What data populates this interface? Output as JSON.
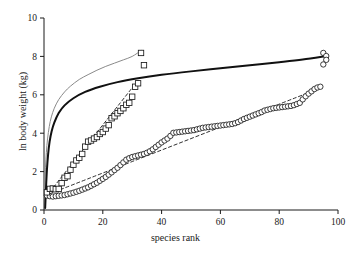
{
  "chart_data": {
    "type": "scatter",
    "title": "",
    "xlabel": "species rank",
    "ylabel": "ln body weight (kg)",
    "xlim": [
      0,
      100
    ],
    "ylim": [
      0,
      10
    ],
    "xticks": [
      0,
      20,
      40,
      60,
      80,
      100
    ],
    "yticks": [
      0,
      2,
      4,
      6,
      8,
      10
    ],
    "xtick_labels": [
      "0",
      "20",
      "40",
      "60",
      "80",
      "100"
    ],
    "ytick_labels": [
      "0",
      "2",
      "4",
      "6",
      "8",
      "10"
    ],
    "grid": false,
    "legend": "none",
    "axis_style": "left-and-bottom-spines-with-outward-ticks",
    "series": [
      {
        "name": "open-circles",
        "marker": "open-circle",
        "color": "#1a1a1a",
        "points": [
          [
            1,
            0.75
          ],
          [
            2,
            0.72
          ],
          [
            3,
            0.7
          ],
          [
            4,
            0.72
          ],
          [
            5,
            0.74
          ],
          [
            6,
            0.76
          ],
          [
            7,
            0.78
          ],
          [
            8,
            0.82
          ],
          [
            9,
            0.86
          ],
          [
            10,
            0.9
          ],
          [
            11,
            0.95
          ],
          [
            12,
            1.0
          ],
          [
            13,
            1.06
          ],
          [
            14,
            1.12
          ],
          [
            15,
            1.18
          ],
          [
            16,
            1.26
          ],
          [
            17,
            1.34
          ],
          [
            18,
            1.42
          ],
          [
            19,
            1.52
          ],
          [
            20,
            1.62
          ],
          [
            21,
            1.72
          ],
          [
            22,
            1.84
          ],
          [
            23,
            1.96
          ],
          [
            24,
            2.08
          ],
          [
            25,
            2.2
          ],
          [
            26,
            2.34
          ],
          [
            27,
            2.48
          ],
          [
            28,
            2.62
          ],
          [
            29,
            2.7
          ],
          [
            30,
            2.76
          ],
          [
            31,
            2.8
          ],
          [
            32,
            2.84
          ],
          [
            33,
            2.88
          ],
          [
            34,
            2.92
          ],
          [
            35,
            2.98
          ],
          [
            36,
            3.06
          ],
          [
            37,
            3.16
          ],
          [
            38,
            3.28
          ],
          [
            39,
            3.4
          ],
          [
            40,
            3.52
          ],
          [
            41,
            3.62
          ],
          [
            42,
            3.72
          ],
          [
            43,
            3.86
          ],
          [
            44,
            4.02
          ],
          [
            45,
            4.04
          ],
          [
            46,
            4.06
          ],
          [
            47,
            4.08
          ],
          [
            48,
            4.1
          ],
          [
            49,
            4.12
          ],
          [
            50,
            4.14
          ],
          [
            51,
            4.16
          ],
          [
            52,
            4.2
          ],
          [
            53,
            4.24
          ],
          [
            54,
            4.28
          ],
          [
            55,
            4.3
          ],
          [
            56,
            4.32
          ],
          [
            57,
            4.34
          ],
          [
            58,
            4.36
          ],
          [
            59,
            4.38
          ],
          [
            60,
            4.4
          ],
          [
            61,
            4.42
          ],
          [
            62,
            4.44
          ],
          [
            63,
            4.46
          ],
          [
            64,
            4.48
          ],
          [
            65,
            4.52
          ],
          [
            66,
            4.58
          ],
          [
            67,
            4.66
          ],
          [
            68,
            4.74
          ],
          [
            69,
            4.8
          ],
          [
            70,
            4.86
          ],
          [
            71,
            4.92
          ],
          [
            72,
            4.98
          ],
          [
            73,
            5.04
          ],
          [
            74,
            5.1
          ],
          [
            75,
            5.18
          ],
          [
            76,
            5.22
          ],
          [
            77,
            5.26
          ],
          [
            78,
            5.3
          ],
          [
            79,
            5.32
          ],
          [
            80,
            5.34
          ],
          [
            81,
            5.36
          ],
          [
            82,
            5.38
          ],
          [
            83,
            5.4
          ],
          [
            84,
            5.42
          ],
          [
            85,
            5.46
          ],
          [
            86,
            5.52
          ],
          [
            87,
            5.58
          ],
          [
            88,
            5.76
          ],
          [
            89,
            5.92
          ],
          [
            90,
            6.06
          ],
          [
            91,
            6.18
          ],
          [
            92,
            6.3
          ],
          [
            93,
            6.38
          ],
          [
            94,
            6.42
          ],
          [
            95,
            8.18
          ],
          [
            96,
            8.02
          ],
          [
            96,
            7.82
          ],
          [
            95,
            7.58
          ]
        ]
      },
      {
        "name": "open-squares",
        "marker": "open-square",
        "color": "#1a1a1a",
        "points": [
          [
            1,
            0.92
          ],
          [
            2,
            1.1
          ],
          [
            3,
            1.12
          ],
          [
            4,
            1.08
          ],
          [
            5,
            1.1
          ],
          [
            6,
            1.4
          ],
          [
            7,
            1.68
          ],
          [
            8,
            1.76
          ],
          [
            9,
            2.1
          ],
          [
            10,
            2.36
          ],
          [
            11,
            2.58
          ],
          [
            12,
            2.72
          ],
          [
            13,
            2.92
          ],
          [
            14,
            3.3
          ],
          [
            15,
            3.56
          ],
          [
            16,
            3.62
          ],
          [
            17,
            3.72
          ],
          [
            18,
            3.8
          ],
          [
            19,
            3.96
          ],
          [
            20,
            4.06
          ],
          [
            21,
            4.24
          ],
          [
            22,
            4.42
          ],
          [
            23,
            4.78
          ],
          [
            24,
            4.88
          ],
          [
            25,
            5.04
          ],
          [
            26,
            5.16
          ],
          [
            27,
            5.3
          ],
          [
            28,
            5.48
          ],
          [
            29,
            5.58
          ],
          [
            30,
            5.9
          ],
          [
            31,
            6.42
          ],
          [
            32,
            6.6
          ],
          [
            33,
            8.18
          ],
          [
            34,
            7.54
          ]
        ]
      }
    ],
    "curves": [
      {
        "name": "thin-grey-log-curve",
        "style": "solid",
        "width": 1.0,
        "color": "#8a8a8a",
        "description": "logarithmic fit rising from near 0 at rank 0 to ~8.3 at rank 33",
        "points": [
          [
            0.15,
            0.3
          ],
          [
            0.3,
            1.3
          ],
          [
            0.5,
            2.2
          ],
          [
            0.8,
            3.0
          ],
          [
            1.2,
            3.7
          ],
          [
            1.8,
            4.35
          ],
          [
            2.5,
            4.85
          ],
          [
            3.5,
            5.3
          ],
          [
            5,
            5.75
          ],
          [
            7,
            6.15
          ],
          [
            9,
            6.45
          ],
          [
            12,
            6.8
          ],
          [
            15,
            7.05
          ],
          [
            18,
            7.28
          ],
          [
            21,
            7.48
          ],
          [
            24,
            7.65
          ],
          [
            27,
            7.82
          ],
          [
            30,
            8.0
          ],
          [
            33,
            8.3
          ]
        ]
      },
      {
        "name": "thick-black-log-curve",
        "style": "solid",
        "width": 2.0,
        "color": "#111111",
        "description": "logarithmic fit rising from near 0 at rank 0 to ~8.0 at rank 96",
        "points": [
          [
            0.4,
            0.1
          ],
          [
            0.7,
            1.2
          ],
          [
            1.0,
            2.1
          ],
          [
            1.4,
            2.9
          ],
          [
            1.9,
            3.55
          ],
          [
            2.6,
            4.1
          ],
          [
            3.5,
            4.55
          ],
          [
            5,
            5.05
          ],
          [
            7,
            5.45
          ],
          [
            10,
            5.82
          ],
          [
            14,
            6.15
          ],
          [
            19,
            6.42
          ],
          [
            25,
            6.66
          ],
          [
            32,
            6.86
          ],
          [
            40,
            7.04
          ],
          [
            50,
            7.22
          ],
          [
            60,
            7.38
          ],
          [
            70,
            7.54
          ],
          [
            80,
            7.7
          ],
          [
            88,
            7.84
          ],
          [
            96,
            8.02
          ]
        ]
      },
      {
        "name": "dashed-line-through-circles",
        "style": "dashed",
        "width": 0.9,
        "color": "#1a1a1a",
        "description": "dashed linear trend through the circle series",
        "points": [
          [
            2,
            0.85
          ],
          [
            94,
            6.35
          ]
        ]
      },
      {
        "name": "dashed-line-through-squares",
        "style": "dashed",
        "width": 0.9,
        "color": "#1a1a1a",
        "description": "dashed linear trend through the square series",
        "points": [
          [
            2,
            0.95
          ],
          [
            32,
            6.75
          ]
        ]
      }
    ]
  }
}
